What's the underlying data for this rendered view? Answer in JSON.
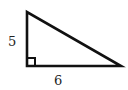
{
  "diagram": {
    "type": "right-triangle",
    "vertices": {
      "top": [
        27,
        12
      ],
      "right_angle": [
        27,
        66
      ],
      "right": [
        121,
        66
      ]
    },
    "right_angle_marker": true,
    "stroke_color": "#111111",
    "labels": {
      "vertical_leg": "5",
      "horizontal_leg": "6"
    }
  }
}
